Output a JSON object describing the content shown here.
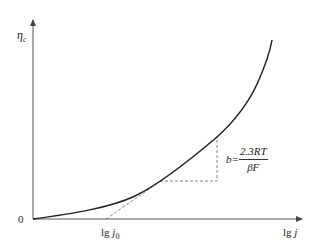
{
  "diagram": {
    "type": "tafel-plot",
    "colors": {
      "axis": "#555555",
      "curve": "#222222",
      "dashed": "#666666",
      "text": "#222222"
    },
    "y_axis": {
      "label_main": "η",
      "label_sub": "c"
    },
    "x_axis": {
      "label": "lg j",
      "label_prefix": "lg",
      "label_var": "j"
    },
    "origin_label": "0",
    "x_marker": {
      "label_prefix": "lg",
      "label_var": "j",
      "label_sub": "0"
    },
    "slope_annotation": {
      "lhs": "b=",
      "numerator": "2.3RT",
      "denominator": "βF"
    }
  }
}
